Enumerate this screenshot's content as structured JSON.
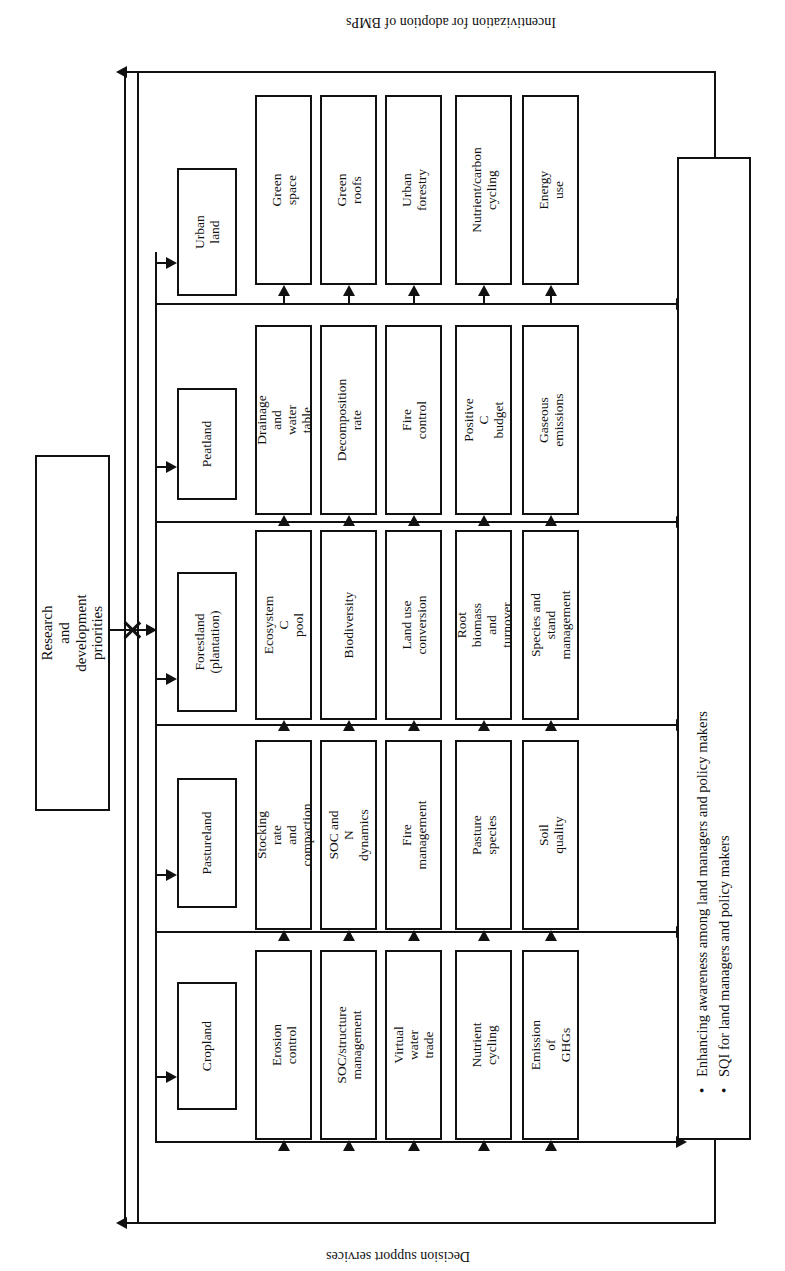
{
  "diagram": {
    "orientation": "rotated-90",
    "loops": {
      "top_label": "Incentivization for adoption of BMPs",
      "bottom_label": "Decision support services"
    },
    "driver": {
      "label": "Research and development priorities"
    },
    "outcome": {
      "bullets": [
        "Enhancing awareness among land managers and policy makers",
        "SQI for land managers and policy makers"
      ]
    },
    "columns": [
      {
        "category": "Urban land",
        "practices": [
          "Green space",
          "Green roofs",
          "Urban forestry",
          "Nutrient/carbon\ncycling",
          "Energy use"
        ]
      },
      {
        "category": "Peatland",
        "practices": [
          "Drainage and\nwater table",
          "Decomposition\nrate",
          "Fire control",
          "Positive C\nbudget",
          "Gaseous\nemissions"
        ]
      },
      {
        "category": "Forestland\n(plantation)",
        "practices": [
          "Ecosystem C\npool",
          "Biodiversity",
          "Land use\nconversion",
          "Root biomass\nand turnover",
          "Species and stand\nmanagement"
        ]
      },
      {
        "category": "Pastureland",
        "practices": [
          "Stocking rate\nand compaction",
          "SOC and N\ndynamics",
          "Fire\nmanagement",
          "Pasture species",
          "Soil quality"
        ]
      },
      {
        "category": "Cropland",
        "practices": [
          "Erosion\ncontrol",
          "SOC/structure\nmanagement",
          "Virtual water\ntrade",
          "Nutrient\ncycling",
          "Emission of\nGHGs"
        ]
      }
    ],
    "colors": {
      "ink": "#111111",
      "paper": "#ffffff"
    }
  }
}
